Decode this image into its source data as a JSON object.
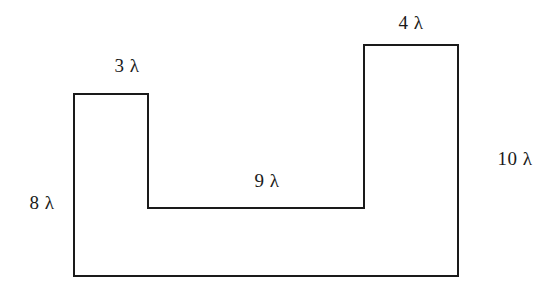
{
  "figure": {
    "units": "lambda",
    "stroke_color": "#1a1a1a",
    "background_color": "#ffffff",
    "stroke_width": 2,
    "viewbox": "0 0 553 293",
    "outline_points": "74,94 148,94 148,208 364,208 364,45 458,45 458,276 74,276",
    "vertices": [
      {
        "name": "left-tower-top-left",
        "x": 74,
        "y": 94
      },
      {
        "name": "left-tower-top-right",
        "x": 148,
        "y": 94
      },
      {
        "name": "notch-bottom-left",
        "x": 148,
        "y": 208
      },
      {
        "name": "notch-bottom-right",
        "x": 364,
        "y": 208
      },
      {
        "name": "right-tower-top-left",
        "x": 364,
        "y": 45
      },
      {
        "name": "right-tower-top-right",
        "x": 458,
        "y": 45
      },
      {
        "name": "bottom-right",
        "x": 458,
        "y": 276
      },
      {
        "name": "bottom-left",
        "x": 74,
        "y": 276
      }
    ],
    "labels": [
      {
        "id": "top-left-width",
        "text": "3 λ",
        "value": 3,
        "symbol": "λ",
        "edge": "left-tower-top",
        "x": 127,
        "y": 65
      },
      {
        "id": "top-right-width",
        "text": "4 λ",
        "value": 4,
        "symbol": "λ",
        "edge": "right-tower-top",
        "x": 411,
        "y": 22
      },
      {
        "id": "left-height",
        "text": "8 λ",
        "value": 8,
        "symbol": "λ",
        "edge": "left-side",
        "x": 42,
        "y": 202
      },
      {
        "id": "inner-width",
        "text": "9 λ",
        "value": 9,
        "symbol": "λ",
        "edge": "notch-bottom",
        "x": 267,
        "y": 180
      },
      {
        "id": "right-height",
        "text": "10 λ",
        "value": 10,
        "symbol": "λ",
        "edge": "right-side",
        "x": 515,
        "y": 158
      }
    ]
  }
}
